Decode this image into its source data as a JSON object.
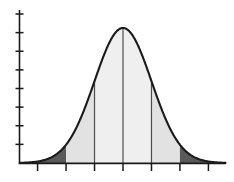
{
  "figure": {
    "title": "Normal distribution curve with shaded standard deviation regions",
    "background_color": "#ffffff"
  },
  "chart_data": {
    "type": "area",
    "title": "",
    "subtitle": "",
    "xlabel": "",
    "ylabel": "",
    "grid": false,
    "legend_position": "none",
    "curve": "normal probability density",
    "mean": 0,
    "sigma": 1,
    "xlim": [
      -3.6,
      3.6
    ],
    "ylim": [
      0,
      0.44
    ],
    "x_tick_values": [
      -3,
      -2,
      -1,
      0,
      1,
      2,
      3
    ],
    "x_tick_labels": [
      "",
      "",
      "",
      "",
      "",
      "",
      ""
    ],
    "y_tick_count": 8,
    "y_tick_labels": [
      "",
      "",
      "",
      "",
      "",
      "",
      "",
      ""
    ],
    "x": [
      -3.6,
      -3.4,
      -3.2,
      -3.0,
      -2.8,
      -2.6,
      -2.4,
      -2.2,
      -2.0,
      -1.8,
      -1.6,
      -1.4,
      -1.2,
      -1.0,
      -0.8,
      -0.6,
      -0.4,
      -0.2,
      0.0,
      0.2,
      0.4,
      0.6,
      0.8,
      1.0,
      1.2,
      1.4,
      1.6,
      1.8,
      2.0,
      2.2,
      2.4,
      2.6,
      2.8,
      3.0,
      3.2,
      3.4,
      3.6
    ],
    "y": [
      0.0006,
      0.0012,
      0.0024,
      0.0044,
      0.0079,
      0.0136,
      0.0224,
      0.0355,
      0.054,
      0.079,
      0.1109,
      0.1497,
      0.1942,
      0.242,
      0.2897,
      0.3332,
      0.3683,
      0.391,
      0.3989,
      0.391,
      0.3683,
      0.3332,
      0.2897,
      0.242,
      0.1942,
      0.1497,
      0.1109,
      0.079,
      0.054,
      0.0355,
      0.0224,
      0.0136,
      0.0079,
      0.0044,
      0.0024,
      0.0012,
      0.0006
    ],
    "regions": [
      {
        "name": "left-tail",
        "range": [
          -3.6,
          -2.0
        ],
        "fill": "#595959",
        "description": "area below minus two standard deviations"
      },
      {
        "name": "left-outer-band",
        "range": [
          -2.0,
          -1.0
        ],
        "fill": "#e2e2e2",
        "description": "area between minus two and minus one standard deviations"
      },
      {
        "name": "left-inner-band",
        "range": [
          -1.0,
          0.0
        ],
        "fill": "#efefef",
        "description": "area between minus one standard deviation and the mean"
      },
      {
        "name": "right-inner-band",
        "range": [
          0.0,
          1.0
        ],
        "fill": "#efefef",
        "description": "area between the mean and plus one standard deviation"
      },
      {
        "name": "right-outer-band",
        "range": [
          1.0,
          2.0
        ],
        "fill": "#e2e2e2",
        "description": "area between plus one and plus two standard deviations"
      },
      {
        "name": "right-tail",
        "range": [
          2.0,
          3.6
        ],
        "fill": "#595959",
        "description": "area above plus two standard deviations"
      }
    ],
    "divider_lines": [
      -1.0,
      0.0,
      1.0
    ],
    "colors": {
      "curve_stroke": "#1a1a1a",
      "axis": "#1a1a1a",
      "tail_fill": "#595959",
      "outer_band_fill": "#e2e2e2",
      "inner_band_fill": "#efefef",
      "divider_stroke": "#4d4d4d"
    }
  }
}
